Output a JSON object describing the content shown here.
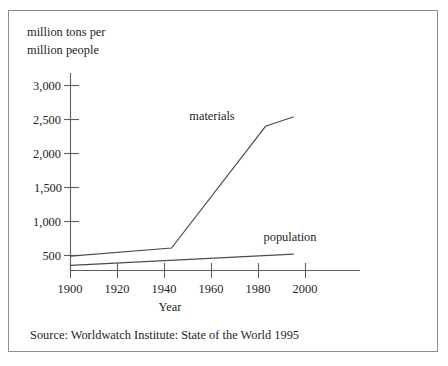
{
  "figure": {
    "source_note": "Source:  Worldwatch Institute:  State of the World 1995"
  },
  "chart_data": {
    "type": "line",
    "title": "",
    "subtitle": "",
    "ylabel_line1": "million tons per",
    "ylabel_line2": "million people",
    "xlabel": "Year",
    "xlim": [
      1900,
      2000
    ],
    "ylim": [
      0,
      3150
    ],
    "grid": false,
    "legend_position": "inline-annotations",
    "xticks": [
      1900,
      1920,
      1940,
      1960,
      1980,
      2000
    ],
    "xtick_labels": [
      "1900",
      "1920",
      "1940",
      "1960",
      "1980",
      "2000"
    ],
    "yticks": [
      500,
      1000,
      1500,
      2000,
      2500,
      3000
    ],
    "ytick_labels": [
      "500",
      "1,000",
      "1,500",
      "2,000",
      "2,500",
      "3,000"
    ],
    "series": [
      {
        "name": "materials",
        "label": "materials",
        "x": [
          1900,
          1943,
          1983,
          1995
        ],
        "values": [
          490,
          610,
          2400,
          2540
        ]
      },
      {
        "name": "population",
        "label": "population",
        "x": [
          1900,
          1995
        ],
        "values": [
          355,
          520
        ]
      }
    ],
    "annotations": [
      {
        "text": "materials",
        "x": 1958,
        "y": 2600
      },
      {
        "text": "population",
        "x": 1975,
        "y": 800
      }
    ]
  }
}
